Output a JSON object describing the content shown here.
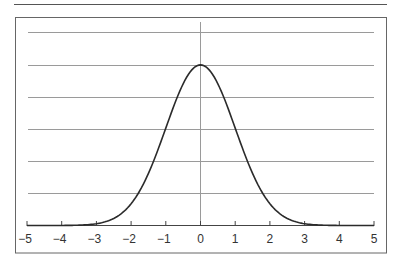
{
  "chart_data": {
    "type": "line",
    "title": "",
    "xlabel": "",
    "ylabel": "",
    "series": [
      {
        "name": "Standard normal density",
        "x": [
          -5,
          -4.5,
          -4,
          -3.5,
          -3,
          -2.5,
          -2,
          -1.5,
          -1,
          -0.5,
          0,
          0.5,
          1,
          1.5,
          2,
          2.5,
          3,
          3.5,
          4,
          4.5,
          5
        ],
        "values": [
          1.5e-06,
          1.6e-05,
          0.000134,
          0.000873,
          0.00443,
          0.0175,
          0.054,
          0.1295,
          0.242,
          0.3521,
          0.3989,
          0.3521,
          0.242,
          0.1295,
          0.054,
          0.0175,
          0.00443,
          0.000873,
          0.000134,
          1.6e-05,
          1.5e-06
        ]
      }
    ],
    "xlim": [
      -5,
      5
    ],
    "ylim": [
      0,
      0.48
    ],
    "x_ticks": [
      -5,
      -4,
      -3,
      -2,
      -1,
      0,
      1,
      2,
      3,
      4,
      5
    ],
    "x_tick_labels": [
      "−5",
      "−4",
      "−3",
      "−2",
      "−1",
      "0",
      "1",
      "2",
      "3",
      "4",
      "5"
    ],
    "y_gridlines": [
      0.08,
      0.16,
      0.24,
      0.32,
      0.4,
      0.48
    ],
    "grid": true,
    "legend": null,
    "colors": {
      "curve": "#2b2b2b",
      "grid": "#9a9a9a",
      "axis": "#444444",
      "frame": "#666666"
    }
  }
}
